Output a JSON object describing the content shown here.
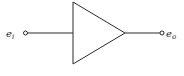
{
  "diagram": {
    "type": "amplifier-schematic",
    "symbol": "triangle-amplifier",
    "input": {
      "label_main": "e",
      "label_sub": "i"
    },
    "output": {
      "label_main": "e",
      "label_sub": "o"
    },
    "colors": {
      "stroke": "#2a2a2a",
      "background": "#ffffff"
    }
  }
}
